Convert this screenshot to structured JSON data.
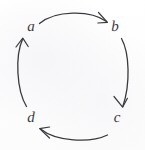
{
  "figure": {
    "kind": "cycle-diagram",
    "width": 145,
    "height": 150,
    "background_color": "#fdfdfd",
    "ink_color": "#3a3a3e",
    "stroke_width": 1.3
  },
  "nodes": [
    {
      "id": "a",
      "label": "a",
      "x": 31,
      "y": 27
    },
    {
      "id": "b",
      "label": "b",
      "x": 115,
      "y": 27
    },
    {
      "id": "c",
      "label": "c",
      "x": 117,
      "y": 118
    },
    {
      "id": "d",
      "label": "d",
      "x": 31,
      "y": 118
    }
  ],
  "edges": [
    {
      "id": "a-to-b",
      "from": "a",
      "to": "b",
      "position": "top",
      "direction": "left-to-right",
      "arrowhead": "open-v"
    },
    {
      "id": "b-to-c",
      "from": "b",
      "to": "c",
      "position": "right",
      "direction": "top-to-bottom",
      "arrowhead": "open-v"
    },
    {
      "id": "c-to-d",
      "from": "c",
      "to": "d",
      "position": "bottom",
      "direction": "right-to-left",
      "arrowhead": "open-v"
    },
    {
      "id": "d-to-a",
      "from": "d",
      "to": "a",
      "position": "left",
      "direction": "bottom-to-top",
      "arrowhead": "open-v"
    }
  ]
}
